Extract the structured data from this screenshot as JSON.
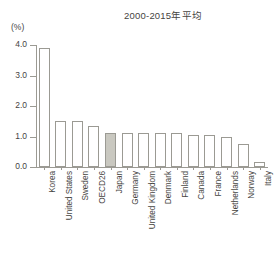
{
  "chart_data": {
    "type": "bar",
    "title": "2000-2015年平均",
    "xlabel": "",
    "ylabel": "(%)",
    "ylim": [
      0.0,
      4.0
    ],
    "yticks": [
      "0.0",
      "1.0",
      "2.0",
      "3.0",
      "4.0"
    ],
    "ytick_values": [
      0.0,
      1.0,
      2.0,
      3.0,
      4.0
    ],
    "grid": false,
    "legend": "none",
    "highlight_category": "Japan",
    "highlight_color": "#c9c8c0",
    "bar_color": "#ffffff",
    "bar_border_color": "#9b9a93",
    "axis_color": "#9b9a93",
    "text_color": "#46443f",
    "categories": [
      "Korea",
      "United States",
      "Sweden",
      "OECD26",
      "Japan",
      "Germany",
      "United Kingdom",
      "Denmark",
      "Finland",
      "Canada",
      "France",
      "Netherlands",
      "Norway",
      "Italy"
    ],
    "values": [
      3.9,
      1.5,
      1.5,
      1.35,
      1.1,
      1.1,
      1.1,
      1.1,
      1.1,
      1.05,
      1.05,
      1.0,
      0.75,
      0.15
    ]
  }
}
